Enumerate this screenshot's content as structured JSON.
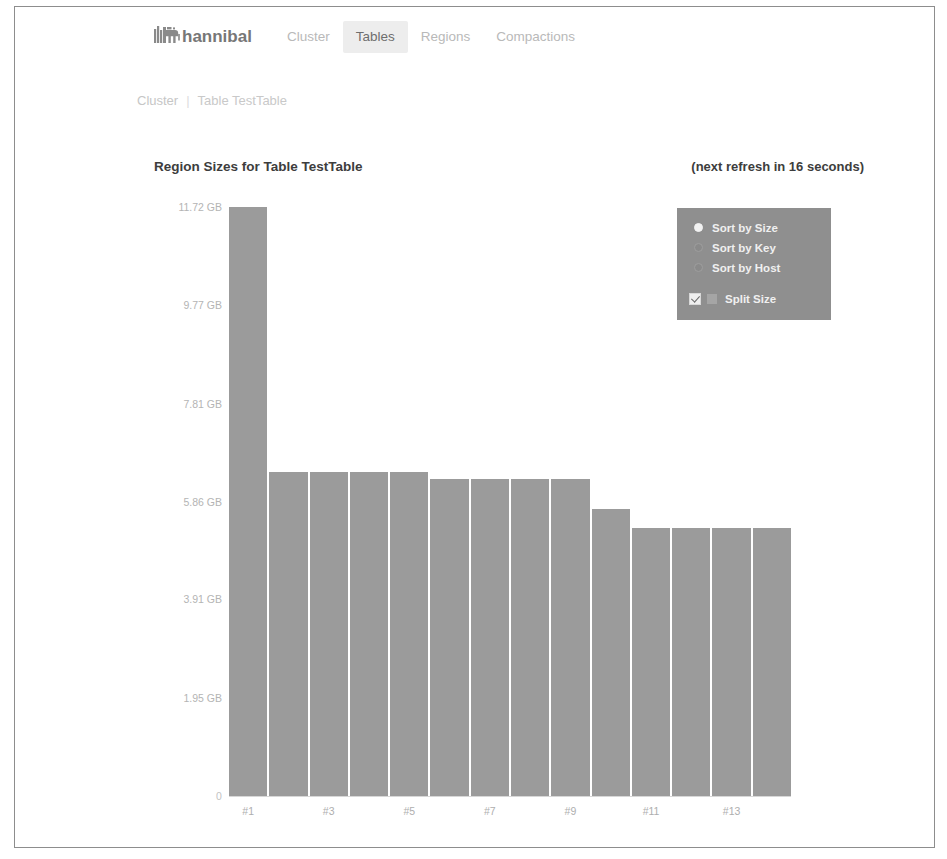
{
  "brand": {
    "name": "hannibal",
    "icon": "elephant-icon"
  },
  "nav": {
    "items": [
      {
        "label": "Cluster",
        "active": false
      },
      {
        "label": "Tables",
        "active": true
      },
      {
        "label": "Regions",
        "active": false
      },
      {
        "label": "Compactions",
        "active": false
      }
    ]
  },
  "breadcrumb": {
    "items": [
      "Cluster",
      "Table TestTable"
    ],
    "separator": "|"
  },
  "header": {
    "title": "Region Sizes for Table TestTable",
    "refresh": "(next refresh in 16 seconds)"
  },
  "controls": {
    "sort_options": [
      {
        "label": "Sort by Size",
        "selected": true
      },
      {
        "label": "Sort by Key",
        "selected": false
      },
      {
        "label": "Sort by Host",
        "selected": false
      }
    ],
    "split_size": {
      "label": "Split Size",
      "checked": true,
      "swatch_color": "#a5a5a5"
    },
    "panel_color": "#8f8f8f"
  },
  "chart_data": {
    "type": "bar",
    "title": "Region Sizes for Table TestTable",
    "xlabel": "",
    "ylabel": "",
    "bar_color": "#9b9b9b",
    "grid": false,
    "legend": null,
    "ylim": [
      0,
      11.72
    ],
    "yunit": "GB",
    "ytick_labels": [
      "11.72 GB",
      "9.77 GB",
      "7.81 GB",
      "5.86 GB",
      "3.91 GB",
      "1.95 GB",
      "0"
    ],
    "ytick_values": [
      11.72,
      9.77,
      7.81,
      5.86,
      3.91,
      1.95,
      0
    ],
    "categories": [
      "#1",
      "#2",
      "#3",
      "#4",
      "#5",
      "#6",
      "#7",
      "#8",
      "#9",
      "#10",
      "#11",
      "#12",
      "#13",
      "#14"
    ],
    "xtick_labels": [
      "#1",
      "#3",
      "#5",
      "#7",
      "#9",
      "#11",
      "#13"
    ],
    "values": [
      11.72,
      6.45,
      6.45,
      6.45,
      6.45,
      6.3,
      6.3,
      6.3,
      6.3,
      5.72,
      5.33,
      5.33,
      5.33,
      5.33
    ]
  }
}
